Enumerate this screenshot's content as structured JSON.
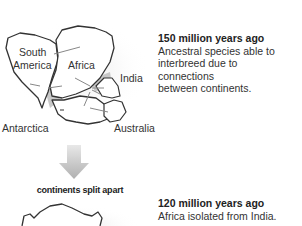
{
  "panel1": {
    "title": "150 million years ago",
    "lines": [
      "Ancestral species able to",
      "interbreed due to",
      "connections",
      "between continents."
    ],
    "labels": {
      "south_america_1": "South",
      "south_america_2": "America",
      "africa": "Africa",
      "india": "India",
      "antarctica": "Antarctica",
      "australia": "Australia"
    }
  },
  "transition": {
    "label": "continents split apart"
  },
  "panel2": {
    "title": "120 million years ago",
    "lines": [
      "Africa isolated from India."
    ]
  },
  "colors": {
    "outline": "#333333",
    "shadow": "#bdbdbd",
    "arrow": "#888888"
  }
}
